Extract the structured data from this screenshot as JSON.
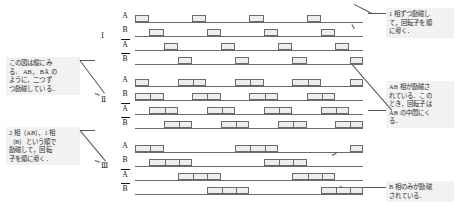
{
  "figure": {
    "kind": "stepper-motor-excitation-timing-diagram",
    "phase_rows": [
      {
        "label": "A",
        "overbar": false
      },
      {
        "label": "B",
        "overbar": false
      },
      {
        "label": "A",
        "overbar": true
      },
      {
        "label": "B",
        "overbar": true
      }
    ],
    "groups": [
      {
        "numeral": "Ⅰ",
        "name": "one-phase-excitation",
        "top": 10,
        "numeral_left": 101,
        "numeral_top": 31,
        "unit": 14.3,
        "pulse_units": 1,
        "segments": 1,
        "period_units": 4,
        "rows": [
          {
            "label": "A",
            "offset_units": 0,
            "count": 5
          },
          {
            "label": "B",
            "offset_units": 1,
            "count": 5
          },
          {
            "label": "Ā",
            "offset_units": 2,
            "count": 5
          },
          {
            "label": "B̄",
            "offset_units": 3,
            "count": 4
          }
        ]
      },
      {
        "numeral": "Ⅱ",
        "name": "two-phase-excitation",
        "top": 74,
        "numeral_left": 101,
        "numeral_top": 95,
        "unit": 14.3,
        "pulse_units": 2,
        "segments": 2,
        "period_units": 4,
        "rows": [
          {
            "label": "A",
            "offset_units": -1,
            "count": 5
          },
          {
            "label": "B",
            "offset_units": 0,
            "count": 5
          },
          {
            "label": "Ā",
            "offset_units": 1,
            "count": 5
          },
          {
            "label": "B̄",
            "offset_units": 2,
            "count": 5
          }
        ]
      },
      {
        "numeral": "Ⅲ",
        "name": "one-two-phase-excitation",
        "top": 140,
        "numeral_left": 101,
        "numeral_top": 161,
        "unit": 14.3,
        "pulse_units": 3,
        "segments": 3,
        "period_units": 8,
        "rows": [
          {
            "label": "A",
            "offset_units": -1,
            "count": 3
          },
          {
            "label": "B",
            "offset_units": 1,
            "count": 3
          },
          {
            "label": "Ā",
            "offset_units": 3,
            "count": 3
          },
          {
            "label": "B̄",
            "offset_units": 5,
            "count": 2
          }
        ]
      }
    ]
  },
  "notes": {
    "top_right": "1 相ずつ励磁し\nて，回転子を順\nに導く．",
    "left_upper": "この図は縦にみ\nる． AB， BĀ の\nように，二つず\nつ励磁している．",
    "left_lower": "2 相（AB），1 相\n（B）という順で\n励磁して，回転\n子を順に導く．",
    "middle_right": "AB 相が励磁さ\nれている．この\nとき，回転子は\nAB の中間にく\nる．",
    "bottom_right": "B 相のみが励磁\nされている．"
  },
  "colors": {
    "background": "#ffffff",
    "line": "#6a6a6a",
    "pulse_fill": "#eeeeee",
    "note_background": "#f2f2f2",
    "text": "#1b1b1b",
    "leader": "#555555"
  }
}
